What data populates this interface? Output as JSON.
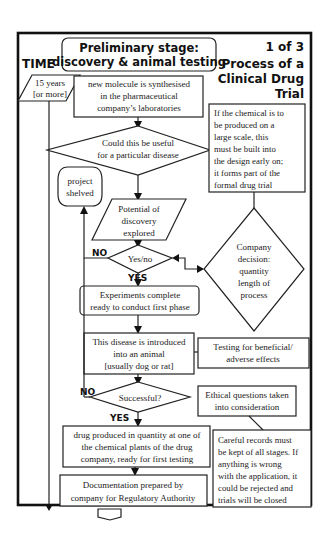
{
  "header": {
    "time_label": "TIME",
    "stage_title_line1": "Preliminary stage:",
    "stage_title_line2": "discovery & animal testing",
    "page_indicator": "1 of 3",
    "process_title_line1": "Process of a",
    "process_title_line2": "Clinical Drug",
    "process_title_line3": "Trial"
  },
  "timeline": {
    "duration_line1": "15 years",
    "duration_line2": "[or more]"
  },
  "nodes": {
    "molecule": [
      "new molecule is synthesised",
      "in the pharmaceutical",
      "company’s laboratories"
    ],
    "useful_question": [
      "Could this be useful",
      "for a particular disease"
    ],
    "large_scale_note": [
      "If the chemical is to",
      "be produced on a",
      "large scale, this",
      "must be built into",
      "the design early on;",
      "it forms part of the",
      "formal drug trial"
    ],
    "project_shelved": [
      "project",
      "shelved"
    ],
    "potential": [
      "Potential of",
      "discovery",
      "explored"
    ],
    "yes_no": [
      "Yes/no"
    ],
    "company_decision": [
      "Company",
      "decision:",
      "quantity",
      "length of",
      "process"
    ],
    "experiments": [
      "Experiments complete",
      "ready to conduct first phase"
    ],
    "disease_animal": [
      "This disease is introduced",
      "into an animal",
      "[usually dog or rat]"
    ],
    "testing_effects": [
      "Testing  for beneficial/",
      "adverse effects"
    ],
    "successful": [
      "Successful?"
    ],
    "ethical": [
      "Ethical questions taken",
      "into consideration"
    ],
    "drug_produced": [
      "drug produced in quantity at one of",
      "the chemical plants of the drug",
      "company,  ready for first testing"
    ],
    "careful_records": [
      "Careful records must",
      "be kept of all stages. If",
      "anything is wrong",
      "with the application, it",
      "could be rejected and",
      "trials will be closed"
    ],
    "documentation": [
      "Documentation prepared by",
      "company for Regulatory Authority"
    ]
  },
  "labels": {
    "no_1": "NO",
    "yes_1": "YES",
    "no_2": "NO",
    "yes_2": "YES"
  }
}
